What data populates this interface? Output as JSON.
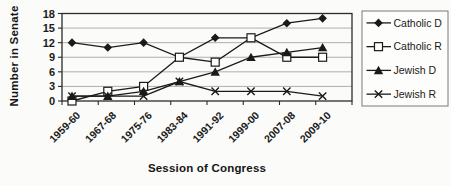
{
  "figure_title": "",
  "colors": {
    "line": "#1a1a1a",
    "grid": "#9c9c9c",
    "border": "#2b2b2b",
    "background": "#fbfbf9",
    "legend_border": "#7a7a7a",
    "legend_fill": "#fdfdfc"
  },
  "chart_data": {
    "type": "line",
    "title": "",
    "xlabel": "Session of Congress",
    "ylabel": "Number in Senate",
    "ylim": [
      0,
      18
    ],
    "yticks": [
      0,
      3,
      6,
      9,
      12,
      15,
      18
    ],
    "grid": true,
    "legend_position": "right",
    "categories": [
      "1959-60",
      "1967-68",
      "1975-76",
      "1983-84",
      "1991-92",
      "1999-00",
      "2007-08",
      "2009-10"
    ],
    "series": [
      {
        "name": "Catholic D",
        "marker": "diamond",
        "values": [
          12,
          11,
          12,
          9,
          13,
          13,
          16,
          17
        ]
      },
      {
        "name": "Catholic R",
        "marker": "square-open",
        "values": [
          0,
          2,
          3,
          9,
          8,
          13,
          9,
          9
        ]
      },
      {
        "name": "Jewish D",
        "marker": "triangle",
        "values": [
          1,
          1,
          2,
          4,
          6,
          9,
          10,
          11
        ]
      },
      {
        "name": "Jewish R",
        "marker": "x",
        "values": [
          1,
          1,
          1,
          4,
          2,
          2,
          2,
          1
        ]
      }
    ]
  }
}
